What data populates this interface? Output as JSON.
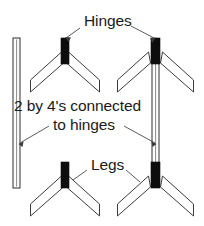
{
  "diagram": {
    "colors": {
      "background": "#ffffff",
      "outline": "#3c3c3c",
      "hinge_fill": "#0d0d0d",
      "leg_fill": "#ffffff",
      "board_fill": "#fdfdfd",
      "text": "#1a1a1a",
      "leader": "#4a4a4a"
    },
    "labels": {
      "hinges": "Hinges",
      "boards_line1": "2 by 4's connected",
      "boards_line2": "to hinges",
      "legs": "Legs"
    },
    "parts": {
      "hinge_count": 4,
      "leg_assembly_count": 4,
      "legs_per_assembly": 2,
      "board_count": 2,
      "hinge_names": [
        "hinge-top-left",
        "hinge-top-right",
        "hinge-bottom-left",
        "hinge-bottom-right"
      ],
      "assembly_names": [
        "leg-assembly-top-left",
        "leg-assembly-top-right",
        "leg-assembly-bottom-left",
        "leg-assembly-bottom-right"
      ],
      "board_names": [
        "board-2by4-left",
        "board-2by4-right"
      ]
    }
  }
}
